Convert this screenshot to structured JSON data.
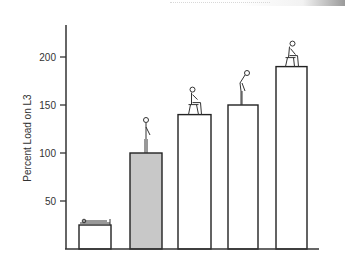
{
  "chart_data": {
    "type": "bar",
    "title": "",
    "xlabel": "",
    "ylabel": "Percent Load on L3",
    "ylim": [
      0,
      230
    ],
    "yticks": [
      50,
      100,
      150,
      200
    ],
    "grid": false,
    "legend": "none",
    "categories": [
      "Lying supine",
      "Standing",
      "Sitting upright",
      "Standing bent forward",
      "Sitting bent forward"
    ],
    "values": [
      25,
      100,
      140,
      150,
      190
    ],
    "bar_colors": [
      "#ffffff",
      "#c8c8c8",
      "#ffffff",
      "#ffffff",
      "#ffffff"
    ],
    "annotations": [
      "figure lying on bed",
      "figure standing upright",
      "figure sitting on stool",
      "figure standing leaning forward",
      "figure sitting on stool leaning forward"
    ]
  },
  "colors": {
    "axis": "#333333",
    "bar_edge": "#222222",
    "highlight_bar": "#c8c8c8"
  }
}
